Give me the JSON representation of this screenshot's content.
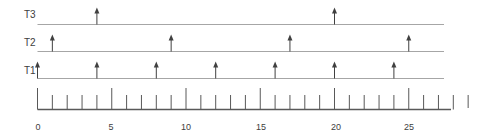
{
  "diagram": {
    "axis": {
      "min": 0,
      "max": 29,
      "major_step": 5,
      "tick_labels": [
        "0",
        "5",
        "10",
        "15",
        "20",
        "25"
      ],
      "tick_label_values": [
        0,
        5,
        10,
        15,
        20,
        25
      ]
    },
    "tasks": [
      {
        "label": "T3",
        "period": 16,
        "release_times": [
          4,
          20
        ]
      },
      {
        "label": "T2",
        "period": 8,
        "release_times": [
          1,
          9,
          17,
          25
        ]
      },
      {
        "label": "T1",
        "period": 4,
        "release_times": [
          0,
          4,
          8,
          12,
          16,
          20,
          24
        ]
      }
    ],
    "colors": {
      "timeline": "#a6a6a6",
      "axis": "#595959",
      "arrow": "#404040",
      "text": "#404040"
    }
  }
}
